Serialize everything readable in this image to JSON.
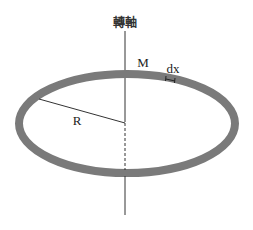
{
  "diagram": {
    "axis_label": "轉軸",
    "mass_label": "M",
    "element_label": "dx",
    "radius_label": "R",
    "colors": {
      "ring": "#7a7a7a",
      "line": "#333333",
      "background": "#ffffff"
    }
  }
}
